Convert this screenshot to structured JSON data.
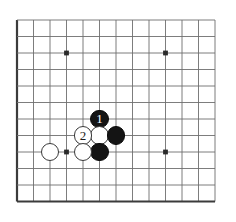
{
  "figure": {
    "kind": "go-board-diagram",
    "title": "",
    "background_color": "#ffffff"
  },
  "board": {
    "visible_columns": 13,
    "visible_rows": 12,
    "origin_x": 17,
    "origin_y": 20,
    "cell_size": 16.5,
    "line_color": "#6e6e6e",
    "edge_line_color": "#3b3b3b",
    "edge_line_width": 2.2,
    "grid_line_width": 0.9,
    "star_point_color": "#2a2a2a",
    "star_point_radius": 2.4,
    "star_points": [
      {
        "col": 3,
        "row": 2,
        "name": "star-point-upper-left"
      },
      {
        "col": 9,
        "row": 2,
        "name": "star-point-upper-right"
      },
      {
        "col": 3,
        "row": 8,
        "name": "star-point-lower-left"
      },
      {
        "col": 9,
        "row": 8,
        "name": "star-point-lower-right"
      }
    ]
  },
  "stones": [
    {
      "id": "black-move-1",
      "name": "black-stone-move-1",
      "color": "black",
      "col": 5,
      "row": 6,
      "label": "1",
      "label_color": "#ffffff"
    },
    {
      "id": "white-unnumbered-a",
      "name": "white-stone-center",
      "color": "white",
      "col": 5,
      "row": 7,
      "label": "",
      "label_color": ""
    },
    {
      "id": "black-unnumbered-right",
      "name": "black-stone-right",
      "color": "black",
      "col": 6,
      "row": 7,
      "label": "",
      "label_color": ""
    },
    {
      "id": "white-move-2",
      "name": "white-stone-move-2",
      "color": "white",
      "col": 4,
      "row": 7,
      "label": "2",
      "label_color": "#1a1a1a"
    },
    {
      "id": "black-unnumbered-below",
      "name": "black-stone-below",
      "color": "black",
      "col": 5,
      "row": 8,
      "label": "",
      "label_color": ""
    },
    {
      "id": "white-unnumbered-b",
      "name": "white-stone-lower",
      "color": "white",
      "col": 4,
      "row": 8,
      "label": "",
      "label_color": ""
    },
    {
      "id": "white-unnumbered-c",
      "name": "white-stone-left",
      "color": "white",
      "col": 2,
      "row": 8,
      "label": "",
      "label_color": ""
    }
  ],
  "stone_style": {
    "radius": 9.4,
    "black_fill": "#141414",
    "white_fill": "#ffffff",
    "white_outline": "#3a3a3a"
  }
}
